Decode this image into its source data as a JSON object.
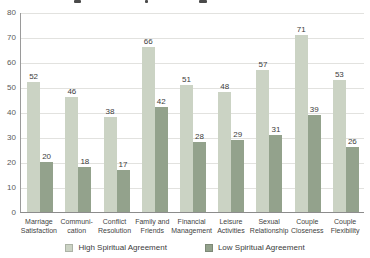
{
  "chart_data": {
    "type": "bar",
    "categories": [
      "Marriage Satisfaction",
      "Communication",
      "Conflict Resolution",
      "Family and Friends",
      "Financial Management",
      "Leisure Activities",
      "Sexual Relationship",
      "Couple Closeness",
      "Couple Flexibility"
    ],
    "category_display_lines": [
      [
        "Marriage",
        "Satisfaction"
      ],
      [
        "Communi-",
        "cation"
      ],
      [
        "Conflict",
        "Resolution"
      ],
      [
        "Family and",
        "Friends"
      ],
      [
        "Financial",
        "Management"
      ],
      [
        "Leisure",
        "Activities"
      ],
      [
        "Sexual",
        "Relationship"
      ],
      [
        "Couple",
        "Closeness"
      ],
      [
        "Couple",
        "Flexibility"
      ]
    ],
    "series": [
      {
        "name": "High Spiritual Agreement",
        "color": "#cbd3c4",
        "values": [
          52,
          46,
          38,
          66,
          51,
          48,
          57,
          71,
          53
        ]
      },
      {
        "name": "Low Spiritual Agreement",
        "color": "#93a28c",
        "values": [
          20,
          18,
          17,
          42,
          28,
          29,
          31,
          39,
          26
        ]
      }
    ],
    "ylim": [
      0,
      80
    ],
    "ytick_step": 10,
    "yticks": [
      0,
      10,
      20,
      30,
      40,
      50,
      60,
      70,
      80
    ],
    "grid": true,
    "value_labels": true,
    "legend_position": "bottom"
  },
  "colors": {
    "gridline": "#e2e2df",
    "axis": "#8c8c8c",
    "label_text": "#3c3c3c"
  }
}
